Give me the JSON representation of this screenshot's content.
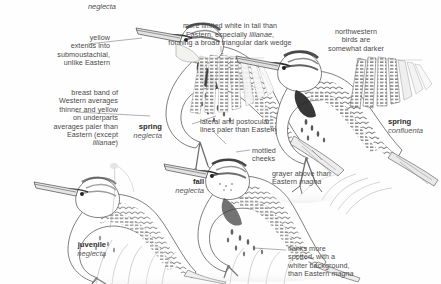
{
  "plate": {
    "title": "Western Meadowlark identification plate",
    "background_color": "#fefefe",
    "text_color": "#4a4a4a"
  },
  "top_label": {
    "text": "neglecta"
  },
  "annotations": [
    {
      "id": "yellow-submoustachial",
      "text": "yellow\nextends into\nsubmoustachial,\nunlike Eastern",
      "align": "right"
    },
    {
      "id": "tail-white",
      "text": "more limited white in tail than\nEastern, especially lilianae,\nforming a broad triangular dark wedge",
      "italic_words": [
        "lilianae"
      ],
      "align": "center"
    },
    {
      "id": "northwestern-darker",
      "text": "northwestern\nbirds are\nsomewhat darker",
      "align": "center"
    },
    {
      "id": "breast-band",
      "text": "breast band of\nWestern averages\nthinner and yellow\non underparts\naverages paler than\nEastern (except\nlilianae)",
      "italic_words": [
        "lilianae"
      ],
      "align": "right"
    },
    {
      "id": "lateral-postocular",
      "text": "lateral and postocular\nlines paler than Eastern",
      "align": "left"
    },
    {
      "id": "mottled-cheeks",
      "text": "mottled\ncheeks",
      "align": "left"
    },
    {
      "id": "grayer-above",
      "text": "grayer above than\nEastern magna",
      "italic_words": [
        "magna"
      ],
      "align": "left"
    },
    {
      "id": "flanks-spotted",
      "text": "flanks more\nspotted, with a\nwhiter background,\nthan Eastern magna",
      "italic_words": [
        "magna"
      ],
      "align": "left"
    }
  ],
  "captions": [
    {
      "id": "spring-neglecta",
      "name": "spring",
      "sci": "neglecta"
    },
    {
      "id": "spring-confluenta",
      "name": "spring",
      "sci": "confluenta"
    },
    {
      "id": "fall-neglecta",
      "name": "fall",
      "sci": "neglecta"
    },
    {
      "id": "juvenile-neglecta",
      "name": "juvenile",
      "sci": "neglecta"
    }
  ]
}
